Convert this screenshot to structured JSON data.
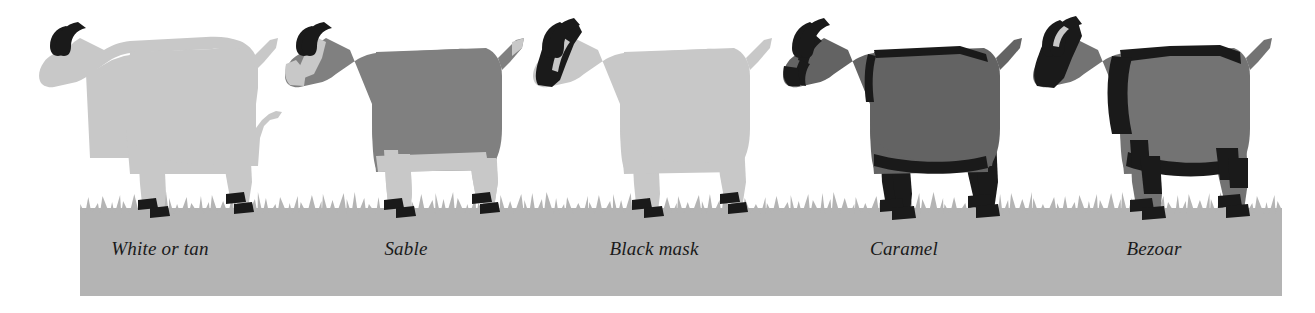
{
  "figure": {
    "variant_count": 5,
    "background_color": "#ffffff",
    "ground_color": "#b4b4b4",
    "grass_color": "#ffffff",
    "hoof_color": "#1a1a1a",
    "horn_color": "#1a1a1a",
    "ground_band": {
      "left": 80,
      "top": 212,
      "width": 1202,
      "height": 84
    },
    "grass_line_y": 208
  },
  "variants": [
    {
      "id": "white-or-tan",
      "label": "White or tan",
      "body_color": "#c8c8c8",
      "belly_color": "#d2d2d2",
      "leg_color": "#c8c8c8",
      "marking_color": "#1a1a1a",
      "markings": [
        "horns",
        "hooves"
      ],
      "description": "Uniform pale coat with no dark body markings"
    },
    {
      "id": "sable",
      "label": "Sable",
      "body_color": "#808080",
      "belly_color": "#c8c8c8",
      "leg_color": "#c8c8c8",
      "marking_color": "#1a1a1a",
      "markings": [
        "horns",
        "hooves",
        "pale-legs",
        "pale-face-stripe",
        "pale-tail"
      ],
      "description": "Dark grey body with pale legs, belly and facial stripe"
    },
    {
      "id": "black-mask",
      "label": "Black mask",
      "body_color": "#c8c8c8",
      "belly_color": "#d2d2d2",
      "leg_color": "#c8c8c8",
      "marking_color": "#1a1a1a",
      "markings": [
        "horns",
        "hooves",
        "black-face-mask"
      ],
      "description": "Pale body with a solid black mask over the face"
    },
    {
      "id": "caramel",
      "label": "Caramel",
      "body_color": "#636363",
      "belly_color": "#6b6b6b",
      "leg_color": "#1a1a1a",
      "marking_color": "#1a1a1a",
      "markings": [
        "horns",
        "hooves",
        "black-legs",
        "black-eye-stripes",
        "black-shoulder-stripe",
        "black-belly-line"
      ],
      "description": "Mid grey body with black legs, eye stripes and shoulder stripe"
    },
    {
      "id": "bezoar",
      "label": "Bezoar",
      "body_color": "#737373",
      "belly_color": "#7b7b7b",
      "leg_color": "#737373",
      "marking_color": "#1a1a1a",
      "markings": [
        "horns",
        "hooves",
        "black-face",
        "black-dorsal-stripe",
        "black-shoulder-band",
        "black-flank-line",
        "black-leg-bands"
      ],
      "description": "Grey body with black face, dorsal stripe, shoulder band and leg bands"
    }
  ]
}
